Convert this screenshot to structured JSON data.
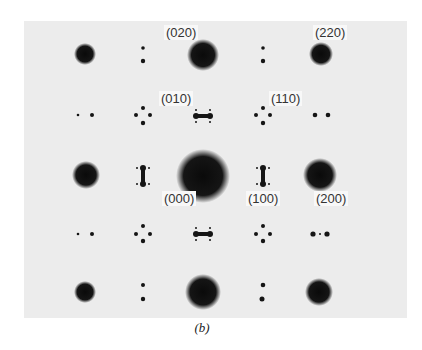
{
  "figure": {
    "caption": "(b)",
    "background_color": "#ececec",
    "spot_color": "#111111"
  },
  "labels": {
    "l020": "(020)",
    "l220": "(220)",
    "l010": "(010)",
    "l110": "(110)",
    "l000": "(000)",
    "l100": "(100)",
    "l200": "(200)"
  },
  "grid": {
    "columns_x": [
      85,
      143,
      203,
      263,
      321
    ],
    "rows_y": [
      54,
      116,
      177,
      234,
      292
    ]
  }
}
